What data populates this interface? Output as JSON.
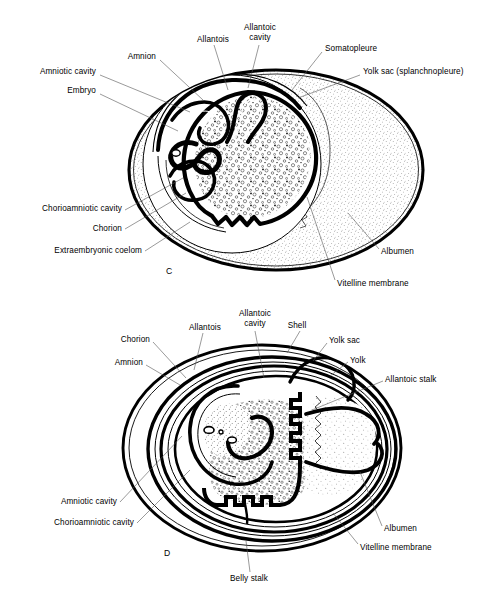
{
  "figure": {
    "type": "scientific-illustration",
    "background_color": "#ffffff",
    "ink_color": "#000000",
    "panels": [
      {
        "id": "C",
        "letter": "C",
        "letter_pos": {
          "x": 166,
          "y": 266
        },
        "egg": {
          "cx": 276,
          "cy": 170,
          "rx": 149,
          "ry": 102
        },
        "labels": [
          {
            "name": "embryo",
            "text": "Embryo",
            "x": 96,
            "y": 90,
            "align": "right",
            "leader": [
              [
                100,
                94
              ],
              [
                178,
                131
              ]
            ]
          },
          {
            "name": "amniotic-cavity",
            "text": "Amniotic cavity",
            "x": 96,
            "y": 71,
            "align": "right",
            "leader": [
              [
                100,
                75
              ],
              [
                190,
                112
              ]
            ]
          },
          {
            "name": "amnion",
            "text": "Amnion",
            "x": 156,
            "y": 56,
            "align": "right",
            "leader": [
              [
                160,
                60
              ],
              [
                203,
                100
              ]
            ]
          },
          {
            "name": "allantois",
            "text": "Allantois",
            "x": 213,
            "y": 39,
            "align": "center",
            "leader": [
              [
                214,
                45
              ],
              [
                228,
                90
              ]
            ]
          },
          {
            "name": "allantoic-cavity",
            "text": "Allantoic\ncavity",
            "x": 260,
            "y": 27,
            "align": "center",
            "leader": [
              [
                259,
                45
              ],
              [
                248,
                88
              ]
            ]
          },
          {
            "name": "somatopleure",
            "text": "Somatopleure",
            "x": 325,
            "y": 48,
            "align": "left",
            "leader": [
              [
                322,
                52
              ],
              [
                292,
                90
              ]
            ]
          },
          {
            "name": "yolk-sac-splanchnopleure",
            "text": "Yolk sac (splanchnopleure)",
            "x": 363,
            "y": 71,
            "align": "left",
            "leader": [
              [
                360,
                75
              ],
              [
                298,
                98
              ]
            ]
          },
          {
            "name": "chorioamniotic-cavity",
            "text": "Chorioamniotic cavity",
            "x": 122,
            "y": 207,
            "align": "right",
            "leader": [
              [
                125,
                210
              ],
              [
                183,
                178
              ]
            ]
          },
          {
            "name": "chorion",
            "text": "Chorion",
            "x": 122,
            "y": 227,
            "align": "right",
            "leader": [
              [
                125,
                229
              ],
              [
                186,
                193
              ]
            ]
          },
          {
            "name": "extraembryonic-coelom",
            "text": "Extraembryonic coelom",
            "x": 142,
            "y": 249,
            "align": "right",
            "leader": [
              [
                145,
                251
              ],
              [
                190,
                222
              ]
            ]
          },
          {
            "name": "albumen",
            "text": "Albumen",
            "x": 381,
            "y": 251,
            "align": "left",
            "leader": [
              [
                379,
                249
              ],
              [
                348,
                213
              ]
            ]
          },
          {
            "name": "vitelline-membrane",
            "text": "Vitelline membrane",
            "x": 337,
            "y": 283,
            "align": "left",
            "leader": [
              [
                335,
                280
              ],
              [
                307,
                197
              ]
            ]
          }
        ]
      },
      {
        "id": "D",
        "letter": "D",
        "letter_pos": {
          "x": 164,
          "y": 548
        },
        "egg": {
          "cx": 262,
          "cy": 448,
          "rx": 141,
          "ry": 105
        },
        "labels": [
          {
            "name": "amnion",
            "text": "Amnion",
            "x": 143,
            "y": 362,
            "align": "right",
            "leader": [
              [
                146,
                365
              ],
              [
                180,
                385
              ]
            ]
          },
          {
            "name": "chorion",
            "text": "Chorion",
            "x": 150,
            "y": 339,
            "align": "right",
            "leader": [
              [
                153,
                342
              ],
              [
                186,
                378
              ]
            ]
          },
          {
            "name": "allantois",
            "text": "Allantois",
            "x": 205,
            "y": 327,
            "align": "center",
            "leader": [
              [
                203,
                333
              ],
              [
                194,
                370
              ]
            ]
          },
          {
            "name": "allantoic-cavity",
            "text": "Allantoic\ncavity",
            "x": 255,
            "y": 313,
            "align": "center",
            "leader": [
              [
                255,
                331
              ],
              [
                264,
                378
              ]
            ]
          },
          {
            "name": "shell",
            "text": "Shell",
            "x": 297,
            "y": 325,
            "align": "center",
            "leader": [
              [
                300,
                331
              ],
              [
                287,
                353
              ]
            ]
          },
          {
            "name": "yolk-sac",
            "text": "Yolk sac",
            "x": 329,
            "y": 340,
            "align": "left",
            "leader": [
              [
                327,
                343
              ],
              [
                313,
                361
              ]
            ]
          },
          {
            "name": "yolk",
            "text": "Yolk",
            "x": 350,
            "y": 360,
            "align": "left",
            "leader": [
              [
                348,
                362
              ],
              [
                330,
                376
              ]
            ]
          },
          {
            "name": "allantoic-stalk",
            "text": "Allantoic stalk",
            "x": 385,
            "y": 379,
            "align": "left",
            "leader": [
              [
                383,
                381
              ],
              [
                312,
                410
              ]
            ]
          },
          {
            "name": "amniotic-cavity",
            "text": "Amniotic cavity",
            "x": 117,
            "y": 500,
            "align": "right",
            "leader": [
              [
                120,
                502
              ],
              [
                182,
                436
              ]
            ]
          },
          {
            "name": "chorioamniotic-cavity",
            "text": "Chorioamniotic cavity",
            "x": 134,
            "y": 521,
            "align": "right",
            "leader": [
              [
                137,
                523
              ],
              [
                190,
                470
              ]
            ]
          },
          {
            "name": "albumen",
            "text": "Albumen",
            "x": 384,
            "y": 528,
            "align": "left",
            "leader": [
              [
                382,
                526
              ],
              [
                360,
                472
              ]
            ]
          },
          {
            "name": "vitelline-membrane",
            "text": "Vitelline membrane",
            "x": 360,
            "y": 547,
            "align": "left",
            "leader": [
              [
                358,
                544
              ],
              [
                333,
                513
              ]
            ]
          },
          {
            "name": "belly-stalk",
            "text": "Belly stalk",
            "x": 249,
            "y": 578,
            "align": "center",
            "leader": [
              [
                250,
                572
              ],
              [
                246,
                541
              ]
            ]
          }
        ]
      }
    ]
  }
}
